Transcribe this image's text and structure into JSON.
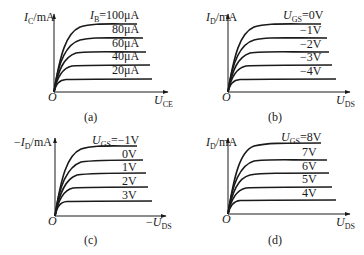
{
  "figure": {
    "panels": [
      {
        "id": "a",
        "caption": "(a)",
        "y_label": {
          "prefix": "",
          "var": "I",
          "sub": "C",
          "unit": "/mA"
        },
        "x_label": {
          "prefix": "",
          "var": "U",
          "sub": "CE"
        },
        "origin_label": "O",
        "param": {
          "var": "I",
          "sub": "B"
        },
        "curve_labels": [
          "=100μA",
          "80μA",
          "60μA",
          "40μA",
          "20μA"
        ]
      },
      {
        "id": "b",
        "caption": "(b)",
        "y_label": {
          "prefix": "",
          "var": "I",
          "sub": "D",
          "unit": "/mA"
        },
        "x_label": {
          "prefix": "",
          "var": "U",
          "sub": "DS"
        },
        "origin_label": "O",
        "param": {
          "var": "U",
          "sub": "GS"
        },
        "curve_labels": [
          "=0V",
          "−1V",
          "−2V",
          "−3V",
          "−4V"
        ]
      },
      {
        "id": "c",
        "caption": "(c)",
        "y_label": {
          "prefix": "−",
          "var": "I",
          "sub": "D",
          "unit": "/mA"
        },
        "x_label": {
          "prefix": "−",
          "var": "U",
          "sub": "DS"
        },
        "origin_label": "O",
        "param": {
          "var": "U",
          "sub": "GS"
        },
        "curve_labels": [
          "=−1V",
          "0V",
          "1V",
          "2V",
          "3V"
        ]
      },
      {
        "id": "d",
        "caption": "(d)",
        "y_label": {
          "prefix": "",
          "var": "I",
          "sub": "D",
          "unit": "/mA"
        },
        "x_label": {
          "prefix": "",
          "var": "U",
          "sub": "DS"
        },
        "origin_label": "O",
        "param": {
          "var": "U",
          "sub": "GS"
        },
        "curve_labels": [
          "=8V",
          "7V",
          "6V",
          "5V",
          "4V"
        ]
      }
    ]
  }
}
